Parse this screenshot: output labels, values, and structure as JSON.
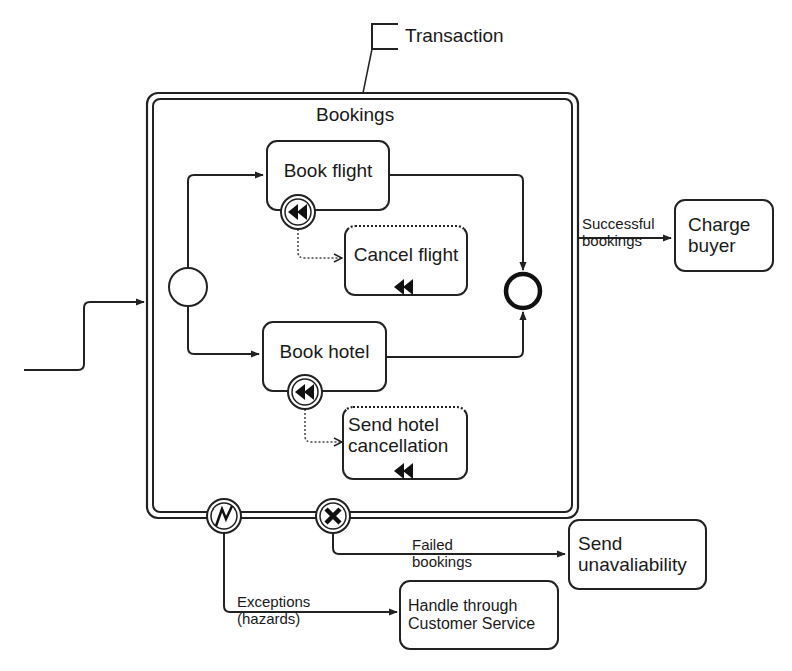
{
  "diagram": {
    "type": "BPMN transaction sub-process with compensation",
    "annotation": {
      "text": "Transaction"
    },
    "subprocess": {
      "title": "Bookings",
      "border": "double"
    },
    "tasks": {
      "book_flight": {
        "label": "Book flight",
        "has_compensation_boundary": true
      },
      "cancel_flight": {
        "label": "Cancel flight",
        "compensation_task": true
      },
      "book_hotel": {
        "label": "Book hotel",
        "has_compensation_boundary": true
      },
      "send_hotel_cancellation": {
        "label": "Send hotel\ncancellation",
        "compensation_task": true
      },
      "charge_buyer": {
        "label": "Charge\nbuyer"
      },
      "send_unavailability": {
        "label": "Send\nunavaliability"
      },
      "handle_customer_service": {
        "label": "Handle through\nCustomer Service"
      }
    },
    "events": {
      "start": {
        "type": "start-event"
      },
      "end": {
        "type": "end-event"
      },
      "error_boundary": {
        "type": "error-boundary-event",
        "icon": "lightning-icon"
      },
      "cancel_boundary": {
        "type": "cancel-boundary-event",
        "icon": "x-icon"
      }
    },
    "flows": {
      "successful": {
        "label_line1": "Successful",
        "label_line2": "bookings"
      },
      "failed": {
        "label_line1": "Failed",
        "label_line2": "bookings"
      },
      "exceptions": {
        "label_line1": "Exceptions",
        "label_line2": "(hazards)"
      }
    },
    "colors": {
      "line": "#222222",
      "background": "#ffffff"
    }
  }
}
